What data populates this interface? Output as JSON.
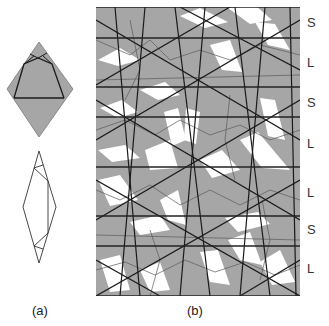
{
  "figure": {
    "panel_a": {
      "caption": "(a)",
      "upper_shape": "shaded rhombus with inscribed decoration lines",
      "lower_shape": "unshaded elongated rhombus with decoration lines"
    },
    "panel_b": {
      "caption": "(b)",
      "description": "Penrose-type tiling with decoration lines, divided into horizontal strips",
      "band_labels": [
        "S",
        "L",
        "S",
        "L",
        "L",
        "S",
        "L"
      ],
      "band_lines_y": [
        7,
        38,
        87,
        117,
        167,
        216,
        246,
        296
      ]
    },
    "colors": {
      "shade": "#a6a6a6",
      "white": "#ffffff",
      "line": "#1a1a1a",
      "thin_line": "#555555"
    }
  }
}
